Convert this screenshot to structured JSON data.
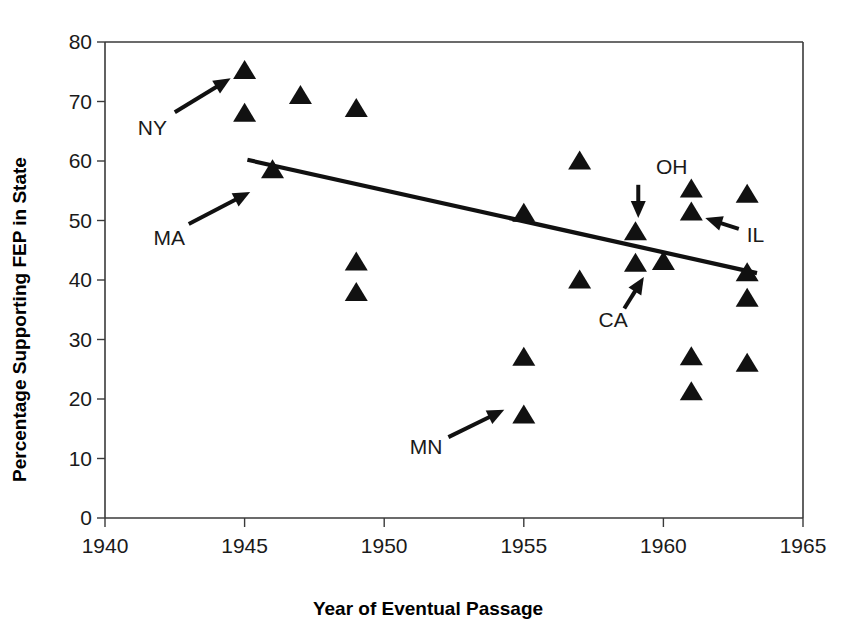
{
  "chart_data": {
    "type": "scatter",
    "title": "",
    "xlabel": "Year of Eventual Passage",
    "ylabel": "Percentage Supporting FEP in State",
    "xlim": [
      1940,
      1965
    ],
    "ylim": [
      0,
      80
    ],
    "xticks": [
      1940,
      1945,
      1950,
      1955,
      1960,
      1965
    ],
    "yticks": [
      0,
      10,
      20,
      30,
      40,
      50,
      60,
      70,
      80
    ],
    "grid": false,
    "legend": null,
    "marker": "triangle",
    "marker_color": "#111111",
    "points": [
      {
        "x": 1945,
        "y": 75.0,
        "label": "NY"
      },
      {
        "x": 1945,
        "y": 67.8,
        "label": ""
      },
      {
        "x": 1947,
        "y": 70.8,
        "label": ""
      },
      {
        "x": 1949,
        "y": 68.6,
        "label": ""
      },
      {
        "x": 1946,
        "y": 58.3,
        "label": "MA"
      },
      {
        "x": 1949,
        "y": 42.8,
        "label": ""
      },
      {
        "x": 1949,
        "y": 37.7,
        "label": ""
      },
      {
        "x": 1955,
        "y": 51.0,
        "label": ""
      },
      {
        "x": 1955,
        "y": 26.8,
        "label": ""
      },
      {
        "x": 1955,
        "y": 17.1,
        "label": "MN"
      },
      {
        "x": 1957,
        "y": 59.8,
        "label": ""
      },
      {
        "x": 1957,
        "y": 39.8,
        "label": ""
      },
      {
        "x": 1959,
        "y": 47.9,
        "label": "OH"
      },
      {
        "x": 1959,
        "y": 42.6,
        "label": "CA"
      },
      {
        "x": 1960,
        "y": 42.9,
        "label": ""
      },
      {
        "x": 1961,
        "y": 55.1,
        "label": ""
      },
      {
        "x": 1961,
        "y": 51.2,
        "label": "IL"
      },
      {
        "x": 1961,
        "y": 26.9,
        "label": ""
      },
      {
        "x": 1961,
        "y": 21.0,
        "label": ""
      },
      {
        "x": 1963,
        "y": 54.2,
        "label": ""
      },
      {
        "x": 1963,
        "y": 41.0,
        "label": ""
      },
      {
        "x": 1963,
        "y": 36.7,
        "label": ""
      },
      {
        "x": 1963,
        "y": 25.8,
        "label": ""
      }
    ],
    "trendline": {
      "x_start": 1945.1,
      "y_start": 60.2,
      "x_end": 1968.3,
      "y_end": 36.0
    },
    "annotations": [
      {
        "text": "NY",
        "label_x": 1941.7,
        "label_y": 65.6,
        "arrow_from_x": 1942.5,
        "arrow_from_y": 68.2,
        "arrow_to_x": 1944.5,
        "arrow_to_y": 73.9
      },
      {
        "text": "MA",
        "label_x": 1942.3,
        "label_y": 47.0,
        "arrow_from_x": 1943.0,
        "arrow_from_y": 49.4,
        "arrow_to_x": 1945.2,
        "arrow_to_y": 54.8
      },
      {
        "text": "MN",
        "label_x": 1951.5,
        "label_y": 12.0,
        "arrow_from_x": 1952.3,
        "arrow_from_y": 13.6,
        "arrow_to_x": 1954.3,
        "arrow_to_y": 18.2
      },
      {
        "text": "OH",
        "label_x": 1960.3,
        "label_y": 59.0,
        "arrow_from_x": 1959.1,
        "arrow_from_y": 56.0,
        "arrow_to_x": 1959.1,
        "arrow_to_y": 50.4
      },
      {
        "text": "CA",
        "label_x": 1958.2,
        "label_y": 33.3,
        "arrow_from_x": 1958.6,
        "arrow_from_y": 35.2,
        "arrow_to_x": 1959.3,
        "arrow_to_y": 40.5
      },
      {
        "text": "IL",
        "label_x": 1963.3,
        "label_y": 47.5,
        "arrow_from_x": 1962.7,
        "arrow_from_y": 48.6,
        "arrow_to_x": 1961.5,
        "arrow_to_y": 50.4
      }
    ]
  },
  "axis": {
    "x_title": "Year of Eventual Passage",
    "y_title": "Percentage Supporting FEP in State",
    "x_tick_labels": [
      "1940",
      "1945",
      "1950",
      "1955",
      "1960",
      "1965"
    ],
    "y_tick_labels": [
      "0",
      "10",
      "20",
      "30",
      "40",
      "50",
      "60",
      "70",
      "80"
    ]
  }
}
